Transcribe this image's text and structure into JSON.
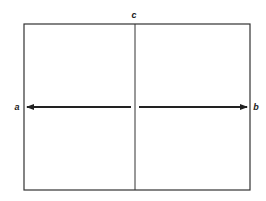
{
  "diagram": {
    "type": "field-division",
    "labels": {
      "left": "a",
      "right": "b",
      "top": "c"
    },
    "arrows": [
      {
        "from": "center",
        "to": "a",
        "direction": "left"
      },
      {
        "from": "center",
        "to": "b",
        "direction": "right"
      }
    ],
    "colors": {
      "stroke": "#333333",
      "background": "#ffffff"
    }
  }
}
